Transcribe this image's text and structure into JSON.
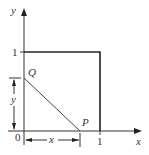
{
  "diagram": {
    "axes": {
      "x_label": "x",
      "y_label": "y",
      "origin_label": "0",
      "x_tick_label": "1",
      "y_tick_label": "1"
    },
    "points": {
      "Q": "Q",
      "P": "P"
    },
    "dimensions": {
      "horizontal": "x",
      "vertical": "y"
    },
    "colors": {
      "stroke": "#333333",
      "square": "#222222"
    }
  }
}
